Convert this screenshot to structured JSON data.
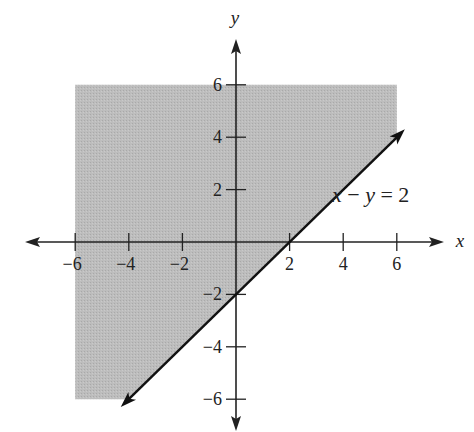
{
  "chart_data": {
    "type": "area",
    "title": "",
    "xlabel": "x",
    "ylabel": "y",
    "xlim": [
      -6,
      6
    ],
    "ylim": [
      -6,
      6
    ],
    "x_ticks": [
      -6,
      -4,
      -2,
      2,
      4,
      6
    ],
    "y_ticks": [
      6,
      4,
      2,
      -2,
      -4,
      -6
    ],
    "x_tick_labels": [
      "−6",
      "−4",
      "−2",
      "2",
      "4",
      "6"
    ],
    "y_tick_labels": [
      "6",
      "4",
      "2",
      "−2",
      "−4",
      "−6"
    ],
    "grid": false,
    "series": [
      {
        "name": "x − y = 2",
        "kind": "line",
        "equation": "y = x - 2",
        "points": [
          [
            -4.3,
            -6.3
          ],
          [
            6.3,
            4.3
          ]
        ]
      },
      {
        "name": "shaded region x − y < 2",
        "kind": "region",
        "polygon": [
          [
            -6,
            6
          ],
          [
            6,
            6
          ],
          [
            6,
            4
          ],
          [
            -4,
            -6
          ],
          [
            -6,
            -6
          ]
        ]
      }
    ],
    "annotations": [
      {
        "text": "x − y = 2",
        "x": 3.6,
        "y": 2.1
      }
    ],
    "colors": {
      "shade": "#b8b8b8",
      "line": "#111111",
      "axis": "#222222"
    }
  },
  "labels": {
    "x_axis": "x",
    "y_axis": "y",
    "equation": "x − y = 2"
  }
}
